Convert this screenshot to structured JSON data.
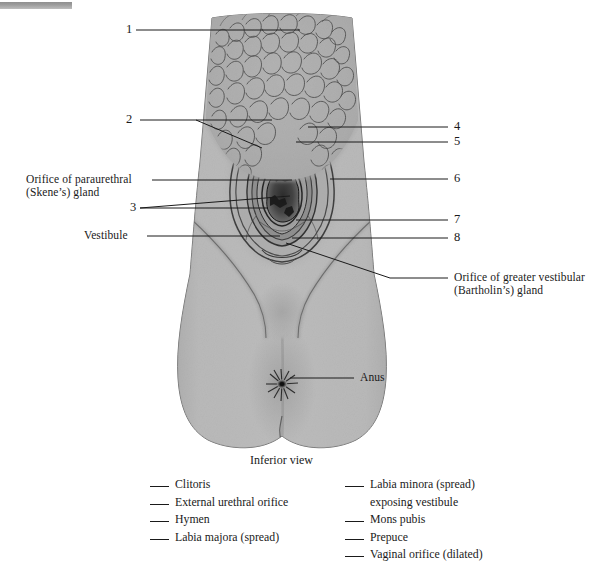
{
  "figure": {
    "caption": "Inferior view",
    "alt_name": "female-external-genitalia-inferior-view"
  },
  "callouts": {
    "left": [
      {
        "id": "1",
        "text": "1",
        "kind": "number"
      },
      {
        "id": "2",
        "text": "2",
        "kind": "number"
      },
      {
        "id": "3",
        "text": "3",
        "kind": "number"
      },
      {
        "id": "skene",
        "text": "Orifice of paraurethral",
        "text2": "(Skene’s) gland",
        "kind": "text"
      },
      {
        "id": "vestibule",
        "text": "Vestibule",
        "kind": "text"
      }
    ],
    "right": [
      {
        "id": "4",
        "text": "4",
        "kind": "number"
      },
      {
        "id": "5",
        "text": "5",
        "kind": "number"
      },
      {
        "id": "6",
        "text": "6",
        "kind": "number"
      },
      {
        "id": "7",
        "text": "7",
        "kind": "number"
      },
      {
        "id": "8",
        "text": "8",
        "kind": "number"
      },
      {
        "id": "bartholin",
        "text": "Orifice of greater vestibular",
        "text2": "(Bartholin’s) gland",
        "kind": "text"
      },
      {
        "id": "anus",
        "text": "Anus",
        "kind": "text"
      }
    ]
  },
  "legend": {
    "column1": [
      {
        "label": "Clitoris"
      },
      {
        "label": "External urethral orifice"
      },
      {
        "label": "Hymen"
      },
      {
        "label": "Labia majora (spread)"
      }
    ],
    "column2": [
      {
        "label": "Labia minora (spread)",
        "label2": "exposing vestibule"
      },
      {
        "label": "Mons pubis"
      },
      {
        "label": "Prepuce"
      },
      {
        "label": "Vaginal orifice (dilated)"
      }
    ]
  },
  "colors": {
    "ink": "#1a1a1a",
    "skin": "#b0b0b0",
    "skin_dark": "#8d8d8d",
    "hair": "#9a9a9a",
    "page": "#ffffff",
    "topbar": "#9c9c9c"
  }
}
